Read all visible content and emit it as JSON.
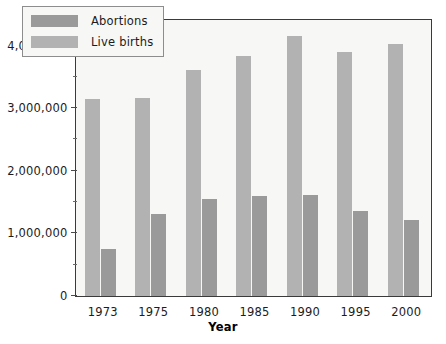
{
  "chart_data": {
    "type": "bar",
    "title": "",
    "xlabel": "Year",
    "ylabel": "",
    "categories": [
      "1973",
      "1975",
      "1980",
      "1985",
      "1990",
      "1995",
      "2000"
    ],
    "series": [
      {
        "name": "Live births",
        "color": "#b2b2b2",
        "values": [
          3140000,
          3170000,
          3610000,
          3830000,
          4160000,
          3900000,
          4030000
        ]
      },
      {
        "name": "Abortions",
        "color": "#9a9a9a",
        "values": [
          745000,
          1310000,
          1550000,
          1590000,
          1610000,
          1360000,
          1210000
        ]
      }
    ],
    "ylim": [
      0,
      4400000
    ],
    "ytick_major": [
      0,
      1000000,
      2000000,
      3000000,
      4000000
    ],
    "ytick_major_labels": [
      "0",
      "1,000,000",
      "2,000,000",
      "3,000,000",
      "4,000,000"
    ],
    "ytick_minor": [
      500000,
      1500000,
      2500000,
      3500000
    ],
    "grid": false,
    "legend_position": "top-left-inside",
    "bar_order_in_group": [
      "Live births",
      "Abortions"
    ]
  },
  "legend": {
    "items": [
      {
        "label": "Abortions",
        "swatch": "abort"
      },
      {
        "label": "Live births",
        "swatch": "live"
      }
    ]
  },
  "axis": {
    "x_title": "Year"
  }
}
